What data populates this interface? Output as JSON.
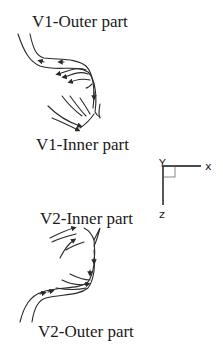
{
  "labels": {
    "v1_outer": "V1-Outer part",
    "v1_inner": "V1-Inner part",
    "v2_inner": "V2-Inner part",
    "v2_outer": "V2-Outer part"
  },
  "axes": {
    "x": "x",
    "y": "Y",
    "z": "z"
  },
  "colors": {
    "stroke": "#2a2a2a",
    "text": "#1a1a1a"
  }
}
